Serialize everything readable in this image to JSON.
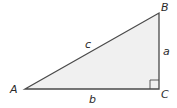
{
  "diagram": {
    "type": "right-triangle",
    "vertices": {
      "A": "A",
      "B": "B",
      "C": "C"
    },
    "sides": {
      "hypotenuse": "c",
      "vertical_leg": "a",
      "horizontal_leg": "b"
    },
    "right_angle_at": "C",
    "colors": {
      "fill": "#f0f0f0",
      "stroke": "#4a4a4a",
      "text": "#2a2a2a"
    }
  }
}
